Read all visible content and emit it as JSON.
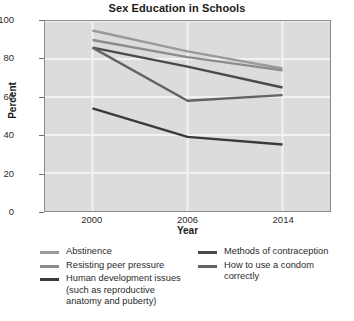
{
  "chart_data": {
    "type": "line",
    "title": "Sex Education in Schools",
    "xlabel": "Year",
    "ylabel": "Percent",
    "categories": [
      "2000",
      "2006",
      "2014"
    ],
    "x_tick_labels": [
      "2000",
      "2006",
      "2014"
    ],
    "y_tick_labels": [
      "0",
      "20",
      "40",
      "60",
      "80",
      "100"
    ],
    "y_ticks": [
      0,
      20,
      40,
      60,
      80,
      100
    ],
    "ylim": [
      0,
      100
    ],
    "grid": true,
    "legend_position": "bottom",
    "plot_background": "#dcdcdc",
    "series": [
      {
        "name": "Abstinence",
        "color": "#9a9a9a",
        "values": [
          95,
          84,
          75
        ]
      },
      {
        "name": "Resisting peer pressure",
        "color": "#8c8c8c",
        "values": [
          90,
          81,
          74
        ]
      },
      {
        "name": "Human development issues (such as reproductive anatomy and puberty)",
        "color": "#3a3a3a",
        "values": [
          54,
          39,
          35
        ]
      },
      {
        "name": "Methods of contraception",
        "color": "#4a4a4a",
        "values": [
          86,
          76,
          65
        ]
      },
      {
        "name": "How to use a condom correctly",
        "color": "#636363",
        "values": [
          86,
          58,
          61
        ]
      }
    ]
  },
  "legend": {
    "left_column": [
      {
        "label": "Abstinence",
        "color": "#9a9a9a"
      },
      {
        "label": "Resisting peer pressure",
        "color": "#8c8c8c"
      },
      {
        "label": "Human development issues",
        "line2": "(such as reproductive",
        "line3": "anatomy and puberty)",
        "color": "#3a3a3a"
      }
    ],
    "right_column": [
      {
        "label": "Methods of contraception",
        "color": "#4a4a4a"
      },
      {
        "label": "How to use a condom",
        "line2": "correctly",
        "color": "#636363"
      }
    ]
  }
}
